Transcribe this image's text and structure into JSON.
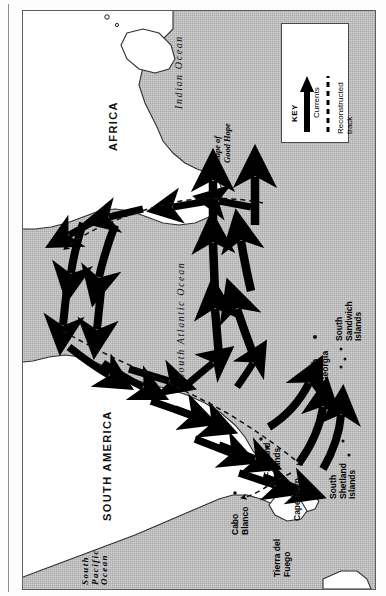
{
  "map": {
    "type": "thematic-ocean-current-map",
    "orientation_note": "map plate printed rotated 90 degrees; all labels read bottom-to-top",
    "frame_color": "#5d5d5d",
    "ocean_fill": "#a9a9a9",
    "land_fill": "#ffffff",
    "arrow_color": "#000000"
  },
  "legend": {
    "title": "KEY",
    "entries": [
      {
        "symbol": "solid-arrow",
        "label": "Currents"
      },
      {
        "symbol": "dashed-line",
        "label": "Reconstructed track"
      }
    ]
  },
  "continents": [
    {
      "name": "AFRICA"
    },
    {
      "name": "SOUTH AMERICA"
    }
  ],
  "oceans": [
    {
      "name": "Indian Ocean"
    },
    {
      "name": "South Atlantic Ocean"
    },
    {
      "name": "South Pacific\nOcean",
      "lines": [
        "South",
        "Pacific",
        "Ocean"
      ]
    }
  ],
  "places": [
    {
      "name": "Cape of\nGood Hope",
      "lines": [
        "Cape of",
        "Good Hope"
      ],
      "style": "italic"
    },
    {
      "name": "South\nGeorgia",
      "lines": [
        "South",
        "Georgia"
      ],
      "marker": "dot"
    },
    {
      "name": "South Sandwich\nIslands",
      "lines": [
        "South Sandwich",
        "Islands"
      ],
      "marker": "dots"
    },
    {
      "name": "South Shetland\nIslands",
      "lines": [
        "South Shetland",
        "Islands"
      ],
      "marker": "dots"
    },
    {
      "name": "Falkland\nIslands",
      "lines": [
        "Falkland",
        "Islands"
      ],
      "marker": "dots"
    },
    {
      "name": "Cape Horn",
      "lines": [
        "Cape Horn"
      ],
      "marker": "dot"
    },
    {
      "name": "Cabo\nBlanco",
      "lines": [
        "Cabo",
        "Blanco"
      ],
      "marker": "dot"
    },
    {
      "name": "Tierra del\nFuego",
      "lines": [
        "Tierra del",
        "Fuego"
      ]
    }
  ]
}
